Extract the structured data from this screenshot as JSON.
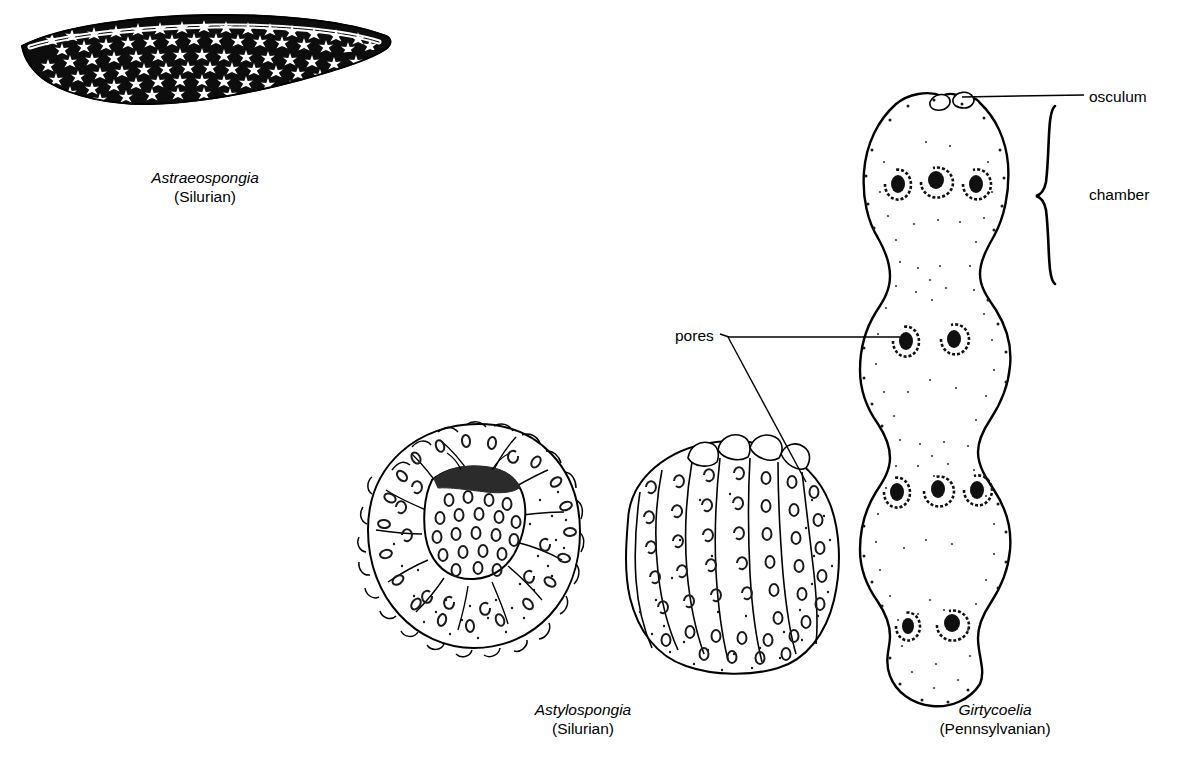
{
  "figure": {
    "kind": "scientific-illustration",
    "background_color": "#ffffff",
    "ink_color": "#000000"
  },
  "specimens": [
    {
      "id": "astraeospongia",
      "genus": "Astraeospongia",
      "age": "(Silurian)",
      "view": "lateral saucer / lens shape",
      "texture": "star-shaped spicules, dark matrix"
    },
    {
      "id": "astylospongia-top",
      "genus": "Astylospongia",
      "age": "(Silurian)",
      "view": "top view, radial lobes with dark central depression",
      "texture": "oval pores"
    },
    {
      "id": "astylospongia-side",
      "genus": "Astylospongia",
      "age": "(Silurian)",
      "view": "side view, ribbed bulb",
      "texture": "oval pores in vertical rows"
    },
    {
      "id": "girtycoelia",
      "genus": "Girtycoelia",
      "age": "(Pennsylvanian)",
      "view": "lateral, four stacked chambers",
      "texture": "stippled shading, dark oval pores"
    }
  ],
  "captions": [
    {
      "genus": "Astraeospongia",
      "age": "(Silurian)"
    },
    {
      "genus": "Astylospongia",
      "age": "(Silurian)"
    },
    {
      "genus": "Girtycoelia",
      "age": "(Pennsylvanian)"
    }
  ],
  "annotations": [
    {
      "label": "osculum",
      "target": "girtycoelia top opening",
      "leader": "horizontal line"
    },
    {
      "label": "chamber",
      "target": "girtycoelia uppermost chamber",
      "leader": "curly brace"
    },
    {
      "label": "pores",
      "target": "girtycoelia and astylospongia pores",
      "leader": "two branching lines"
    }
  ]
}
